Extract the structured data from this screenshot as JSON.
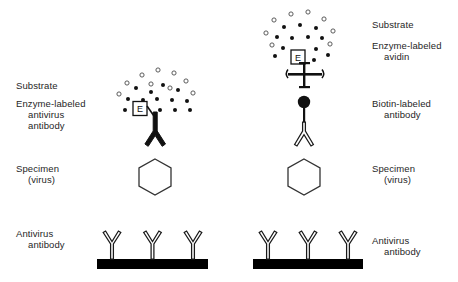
{
  "figure": {
    "background_color": "#ffffff",
    "ink_color": "#111111"
  },
  "panels": [
    {
      "id": "left-panel",
      "name": "direct-enzyme-labeled-antibody-assay",
      "labels": [
        {
          "id": "left-substrate",
          "text": "Substrate",
          "x": 16,
          "y": 86
        },
        {
          "id": "left-enzyme-antibody-line1",
          "text": "Enzyme-labeled",
          "x": 16,
          "y": 104
        },
        {
          "id": "left-enzyme-antibody-line2",
          "text": "antivirus",
          "x": 28,
          "y": 115
        },
        {
          "id": "left-enzyme-antibody-line3",
          "text": "antibody",
          "x": 28,
          "y": 126
        },
        {
          "id": "left-specimen-line1",
          "text": "Specimen",
          "x": 16,
          "y": 168
        },
        {
          "id": "left-specimen-line2",
          "text": "(virus)",
          "x": 28,
          "y": 179
        },
        {
          "id": "left-antivirus-line1",
          "text": "Antivirus",
          "x": 16,
          "y": 233
        },
        {
          "id": "left-antivirus-line2",
          "text": "antibody",
          "x": 28,
          "y": 244
        }
      ],
      "enzyme_box_text": "E",
      "substrate_open_dots": 9,
      "product_filled_dots": 13
    },
    {
      "id": "right-panel",
      "name": "biotin-avidin-amplified-assay",
      "labels": [
        {
          "id": "right-substrate",
          "text": "Substrate",
          "x": 372,
          "y": 25
        },
        {
          "id": "right-enzyme-avidin-line1",
          "text": "Enzyme-labeled",
          "x": 372,
          "y": 46
        },
        {
          "id": "right-enzyme-avidin-line2",
          "text": "avidin",
          "x": 384,
          "y": 57
        },
        {
          "id": "right-biotin-antibody-line1",
          "text": "Biotin-labeled",
          "x": 372,
          "y": 104
        },
        {
          "id": "right-biotin-antibody-line2",
          "text": "antibody",
          "x": 384,
          "y": 115
        },
        {
          "id": "right-specimen-line1",
          "text": "Specimen",
          "x": 372,
          "y": 168
        },
        {
          "id": "right-specimen-line2",
          "text": "(virus)",
          "x": 384,
          "y": 179
        },
        {
          "id": "right-antivirus-line1",
          "text": "Antivirus",
          "x": 372,
          "y": 240
        },
        {
          "id": "right-antivirus-line2",
          "text": "antibody",
          "x": 384,
          "y": 251
        }
      ],
      "enzyme_box_text": "E",
      "substrate_open_dots": 8,
      "product_filled_dots": 12
    }
  ],
  "shapes": {
    "specimen_shape": "hexagon",
    "solid_support_shape": "bar",
    "capture_antibodies_per_support": 3,
    "avidin_shape": "cross",
    "biotin_shape": "filled-circle"
  }
}
